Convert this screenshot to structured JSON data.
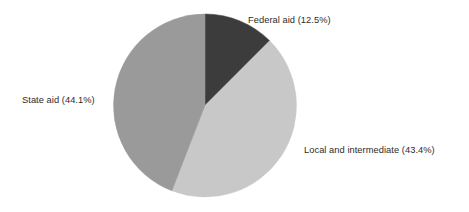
{
  "chart_data": {
    "type": "pie",
    "title": "",
    "subtitle": "",
    "xlabel": "",
    "ylabel": "",
    "grid": false,
    "legend_position": "none",
    "labels_position": "outside-callout",
    "start_angle_deg": 0,
    "direction": "clockwise",
    "categories": [
      "Federal aid",
      "Local and intermediate",
      "State aid"
    ],
    "values": [
      12.5,
      43.4,
      44.1
    ],
    "units": "percent",
    "total": 100.0,
    "slices": [
      {
        "name": "Federal aid",
        "value": 12.5,
        "value_text": "12.5%",
        "label": "Federal aid (12.5%)",
        "color": "#3c3c3c",
        "start_deg": 0,
        "sweep_deg": 45.0
      },
      {
        "name": "Local and intermediate",
        "value": 43.4,
        "value_text": "43.4%",
        "label": "Local and intermediate (43.4%)",
        "color": "#c8c8c8",
        "start_deg": 45.0,
        "sweep_deg": 156.24
      },
      {
        "name": "State aid",
        "value": 44.1,
        "value_text": "44.1%",
        "label": "State aid (44.1%)",
        "color": "#9a9a9a",
        "start_deg": 201.24,
        "sweep_deg": 158.76
      }
    ],
    "annotations": []
  },
  "colors": {
    "background": "#ffffff",
    "text": "#2b2b2b",
    "federal_aid": "#3c3c3c",
    "local_and_intermediate": "#c8c8c8",
    "state_aid": "#9a9a9a"
  },
  "labels": {
    "federal_aid": "Federal aid (12.5%)",
    "local_and_intermediate": "Local and intermediate (43.4%)",
    "state_aid": "State aid (44.1%)"
  }
}
